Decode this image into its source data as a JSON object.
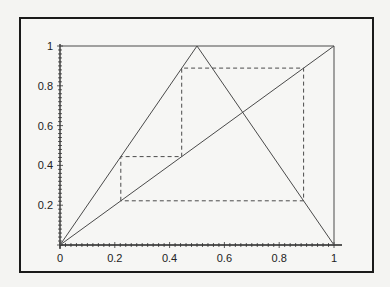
{
  "chart_data": {
    "type": "line",
    "title": "",
    "xlabel": "",
    "ylabel": "",
    "xlim": [
      0,
      1
    ],
    "ylim": [
      0,
      1
    ],
    "grid": false,
    "x_ticks": [
      "0",
      "0.2",
      "0.4",
      "0.6",
      "0.8",
      "1"
    ],
    "y_ticks": [
      "0.2",
      "0.4",
      "0.6",
      "0.8",
      "1"
    ],
    "series": [
      {
        "name": "tent map",
        "style": "solid",
        "x": [
          0,
          0.5,
          1
        ],
        "y": [
          0,
          1,
          0
        ]
      },
      {
        "name": "identity y=x",
        "style": "solid",
        "x": [
          0,
          1
        ],
        "y": [
          0,
          1
        ]
      },
      {
        "name": "top boundary",
        "style": "solid",
        "x": [
          0,
          1
        ],
        "y": [
          1,
          1
        ]
      },
      {
        "name": "right boundary",
        "style": "solid",
        "x": [
          1,
          1
        ],
        "y": [
          0,
          1
        ]
      },
      {
        "name": "cobweb orbit",
        "style": "dashed",
        "x": [
          0.222,
          0.222,
          0.444,
          0.444,
          0.889,
          0.889,
          0.222
        ],
        "y": [
          0.222,
          0.444,
          0.444,
          0.889,
          0.889,
          0.222,
          0.222
        ]
      }
    ],
    "annotations": []
  }
}
